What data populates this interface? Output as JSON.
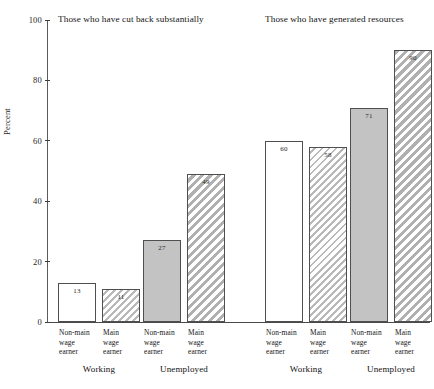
{
  "chart_data": {
    "type": "bar",
    "title": "",
    "xlabel": "",
    "ylabel": "Percent",
    "ylim": [
      0,
      100
    ],
    "yticks": [
      0,
      20,
      40,
      60,
      80,
      100
    ],
    "ytick_labels": [
      "0",
      "20",
      "40",
      "60",
      "80",
      "100"
    ],
    "grid": false,
    "legend": "none",
    "panels": [
      {
        "title": "Those who have cut back substantially",
        "groups": [
          {
            "label": "Working",
            "bars": [
              {
                "category": "Non-main\nwage\nearner",
                "value": 13,
                "style": "white"
              },
              {
                "category": "Main\nwage\nearner",
                "value": 11,
                "style": "white-hatch"
              }
            ]
          },
          {
            "label": "Unemployed",
            "bars": [
              {
                "category": "Non-main\nwage\nearner",
                "value": 27,
                "style": "gray"
              },
              {
                "category": "Main\nwage\nearner",
                "value": 49,
                "style": "gray-hatch"
              }
            ]
          }
        ]
      },
      {
        "title": "Those who have generated resources",
        "groups": [
          {
            "label": "Working",
            "bars": [
              {
                "category": "Non-main\nwage\nearner",
                "value": 60,
                "style": "white"
              },
              {
                "category": "Main\nwage\nearner",
                "value": 58,
                "style": "white-hatch"
              }
            ]
          },
          {
            "label": "Unemployed",
            "bars": [
              {
                "category": "Non-main\nwage\nearner",
                "value": 71,
                "style": "gray"
              },
              {
                "category": "Main\nwage\nearner",
                "value": 90,
                "style": "gray-hatch"
              }
            ]
          }
        ]
      }
    ]
  },
  "caption": ""
}
